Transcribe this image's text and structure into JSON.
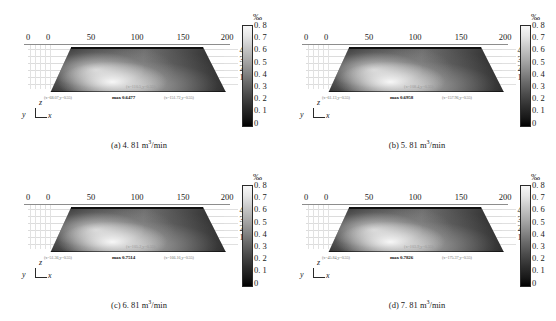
{
  "figure": {
    "panel_count": 4,
    "colorbar": {
      "title": "‰",
      "unit_label": "%",
      "ticks": [
        "0. 8",
        "0. 7",
        "0. 6",
        "0. 5",
        "0. 4",
        "0. 3",
        "0. 2",
        "0. 1",
        "0"
      ],
      "min": 0,
      "max": 0.8
    },
    "axes": {
      "x_ticks": [
        "0",
        "0",
        "50",
        "100",
        "150",
        "200"
      ],
      "z_ticks": [
        "40",
        "30",
        "20",
        "10",
        "0"
      ],
      "triad": {
        "z": "z",
        "y": "y",
        "x": "x"
      }
    }
  },
  "chart_data": {
    "type": "heatmap",
    "xlabel": "x",
    "ylabel": "z",
    "zlabel": "y",
    "legend_title": "‰",
    "colorbar_ticks": [
      0.8,
      0.7,
      0.6,
      0.5,
      0.4,
      0.3,
      0.2,
      0.1,
      0
    ],
    "clim": [
      0,
      0.8
    ],
    "xlim": [
      0,
      200
    ],
    "zlim": [
      0,
      40
    ],
    "grid": true,
    "legend_position": "right",
    "colormap": "grayscale",
    "panels": [
      {
        "id": "a",
        "caption_label": "(a)",
        "caption_value": "4. 81",
        "caption_unit": "m3/min",
        "flow_rate": 4.81,
        "max_value": 0.6477,
        "max_label": "max 0.6477",
        "probe_left": "(x=68.07,y=0.55)",
        "probe_right": "(x=151.72,y=0.55)",
        "probe_mid": "(x=110.5,y=0.55)"
      },
      {
        "id": "b",
        "caption_label": "(b)",
        "caption_value": "5. 81",
        "caption_unit": "m3/min",
        "flow_rate": 5.81,
        "max_value": 0.6958,
        "max_label": "max 0.6958",
        "probe_left": "(x=61.13,y=0.55)",
        "probe_right": "(x=157.96,y=0.55)",
        "probe_mid": "(x=108.4,y=0.55)"
      },
      {
        "id": "c",
        "caption_label": "(c)",
        "caption_value": "6. 81",
        "caption_unit": "m3/min",
        "flow_rate": 6.81,
        "max_value": 0.7514,
        "max_label": "max 0.7514",
        "probe_left": "(x=51.36,y=0.55)",
        "probe_right": "(x=166.16,y=0.55)",
        "probe_mid": "(x=105.2,y=0.55)"
      },
      {
        "id": "d",
        "caption_label": "(d)",
        "caption_value": "7. 81",
        "caption_unit": "m3/min",
        "flow_rate": 7.81,
        "max_value": 0.7826,
        "max_label": "max 0.7826",
        "probe_left": "(x=45.84,y=0.55)",
        "probe_right": "(x=175.37,y=0.55)",
        "probe_mid": "(x=103.9,y=0.55)"
      }
    ]
  }
}
